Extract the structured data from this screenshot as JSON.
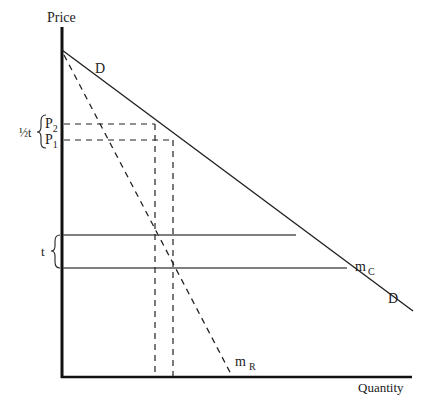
{
  "diagram": {
    "type": "economics-supply-demand",
    "axes": {
      "y_label": "Price",
      "x_label": "Quantity"
    },
    "curves": {
      "demand_label_top": "D",
      "demand_label_bottom": "D",
      "marginal_revenue_label": "m",
      "marginal_revenue_sub": "R",
      "marginal_cost_label": "m",
      "marginal_cost_sub": "C"
    },
    "price_labels": {
      "p2": "P",
      "p2_sub": "2",
      "p1": "P",
      "p1_sub": "1",
      "half_tax": "½t",
      "tax": "t"
    },
    "colors": {
      "line": "#222222",
      "axis": "#111111",
      "horizontal": "#555555"
    }
  }
}
